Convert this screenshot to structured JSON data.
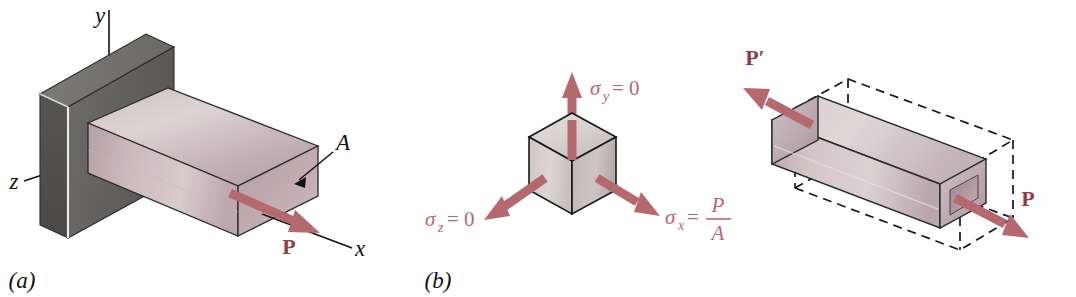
{
  "figure": {
    "background_color": "#ffffff",
    "panels": [
      {
        "id": "a",
        "caption": "(a)",
        "description": "Rectangular bar fixed to a wall, loaded axially by force P along the x-axis"
      },
      {
        "id": "b",
        "caption": "(b)",
        "description": "Stress element cube showing uniaxial state of stress"
      },
      {
        "id": "c",
        "caption": "",
        "description": "Deformed bar elongated along x and contracted laterally, shown with dashed original outline, loaded by P and P-prime"
      }
    ]
  },
  "panel_a": {
    "caption": "(a)",
    "axes": [
      {
        "name": "y",
        "label": "y"
      },
      {
        "name": "z",
        "label": "z"
      },
      {
        "name": "x",
        "label": "x"
      }
    ],
    "area_label": "A",
    "force_label": "P"
  },
  "panel_b": {
    "caption": "(b)",
    "stresses": [
      {
        "name": "sigma-y",
        "symbol": "σ",
        "subscript": "y",
        "relation": "= 0",
        "full": "σy = 0",
        "direction": "up"
      },
      {
        "name": "sigma-z",
        "symbol": "σ",
        "subscript": "z",
        "relation": "= 0",
        "full": "σz = 0",
        "direction": "down-left"
      },
      {
        "name": "sigma-x",
        "symbol": "σ",
        "subscript": "x",
        "relation": "=",
        "numerator": "P",
        "denominator": "A",
        "full": "σx = P/A",
        "direction": "down-right"
      }
    ]
  },
  "panel_c": {
    "force_left_label": "P′",
    "force_right_label": "P",
    "original_outline_style": "dashed",
    "deformed_body_style": "solid"
  },
  "colors": {
    "arrow_red": "#b4696e",
    "arrow_red_dark": "#8c3f46",
    "wall_gray": "#63625f",
    "wall_gray_dark": "#4c4b49",
    "bar_light": "#d6c7cb",
    "bar_mid": "#c1adb3",
    "bar_dark": "#a8949a",
    "cube_light": "#ded7d6",
    "cube_mid": "#c9c2c1",
    "cube_dark": "#b5adad",
    "outline": "#1a1a1a",
    "background": "#ffffff"
  }
}
